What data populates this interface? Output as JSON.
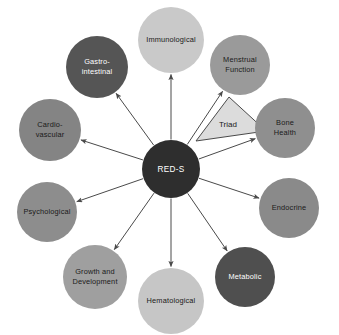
{
  "diagram": {
    "type": "hub-and-spoke",
    "title": "RED-S",
    "canvas": {
      "width": 339,
      "height": 335,
      "background": "#ffffff"
    },
    "hub": {
      "label": "RED-S",
      "cx": 171,
      "cy": 169,
      "r": 29,
      "fill": "#2e2e2e",
      "text_color": "#ffffff"
    },
    "triad": {
      "label": "Triad",
      "fill": "#dcdcdc",
      "stroke": "#4a4a4a",
      "label_x": 228,
      "label_y": 125,
      "points": "196,141 229,97 266,131"
    },
    "arrow_color": "#4a4a4a",
    "nodes": [
      {
        "id": "immunological",
        "label": "Immunological",
        "lines": [
          "Immunological"
        ],
        "cx": 171,
        "cy": 40,
        "r": 33,
        "fill": "#c9c9c9",
        "text_color": "#1a1a1a"
      },
      {
        "id": "menstrual-function",
        "label": "Menstrual Function",
        "lines": [
          "Menstrual",
          "Function"
        ],
        "cx": 240,
        "cy": 65,
        "r": 30,
        "fill": "#9a9a9a",
        "text_color": "#1a1a1a"
      },
      {
        "id": "bone-health",
        "label": "Bone Health",
        "lines": [
          "Bone",
          "Health"
        ],
        "cx": 285,
        "cy": 128,
        "r": 30,
        "fill": "#8f8f8f",
        "text_color": "#1a1a1a"
      },
      {
        "id": "endocrine",
        "label": "Endocrine",
        "lines": [
          "Endocrine"
        ],
        "cx": 289,
        "cy": 208,
        "r": 30,
        "fill": "#8a8a8a",
        "text_color": "#1a1a1a"
      },
      {
        "id": "metabolic",
        "label": "Metabolic",
        "lines": [
          "Metabolic"
        ],
        "cx": 245,
        "cy": 277,
        "r": 30,
        "fill": "#4f4f4f",
        "text_color": "#ffffff"
      },
      {
        "id": "hematological",
        "label": "Hematological",
        "lines": [
          "Hematological"
        ],
        "cx": 171,
        "cy": 301,
        "r": 33,
        "fill": "#c6c6c6",
        "text_color": "#1a1a1a"
      },
      {
        "id": "growth-and-development",
        "label": "Growth and Development",
        "lines": [
          "Growth and",
          "Development"
        ],
        "cx": 95,
        "cy": 277,
        "r": 32,
        "fill": "#9f9f9f",
        "text_color": "#1a1a1a"
      },
      {
        "id": "psychological",
        "label": "Psychological",
        "lines": [
          "Psychological"
        ],
        "cx": 47,
        "cy": 212,
        "r": 30,
        "fill": "#8d8d8d",
        "text_color": "#1a1a1a"
      },
      {
        "id": "cardio-vascular",
        "label": "Cardio-vascular",
        "lines": [
          "Cardio-",
          "vascular"
        ],
        "cx": 50,
        "cy": 130,
        "r": 31,
        "fill": "#848484",
        "text_color": "#1a1a1a"
      },
      {
        "id": "gastro-intestinal",
        "label": "Gastro-intestinal",
        "lines": [
          "Gastro-",
          "intestinal"
        ],
        "cx": 97,
        "cy": 67,
        "r": 31,
        "fill": "#555555",
        "text_color": "#ffffff"
      }
    ]
  }
}
